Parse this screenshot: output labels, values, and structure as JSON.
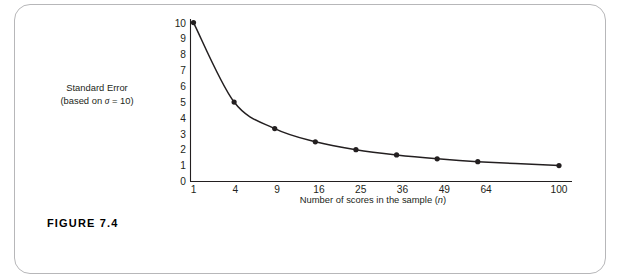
{
  "figure": {
    "caption": "FIGURE 7.4",
    "frame_color": "#b7b7b9",
    "background": "#ffffff"
  },
  "chart_data": {
    "type": "line",
    "title": "",
    "subtitle": "",
    "xlabel": "Number of scores in the sample (n)",
    "ylabel": "Standard Error (based on σ = 10)",
    "ylabel_line1": "Standard Error",
    "ylabel_line2_prefix": "(based on ",
    "ylabel_line2_sigma": "σ",
    "ylabel_line2_suffix": " = 10)",
    "xlabel_prefix": "Number of scores in the sample (",
    "xlabel_var": "n",
    "xlabel_suffix": ")",
    "x": [
      1,
      4,
      9,
      16,
      25,
      36,
      49,
      64,
      100
    ],
    "values": [
      10,
      5,
      3.33,
      2.5,
      2,
      1.67,
      1.43,
      1.25,
      1
    ],
    "xticks": [
      "1",
      "4",
      "9",
      "16",
      "25",
      "36",
      "49",
      "64",
      "100"
    ],
    "xtick_values": [
      1,
      4,
      9,
      16,
      25,
      36,
      49,
      64,
      100
    ],
    "yticks": [
      "0",
      "1",
      "2",
      "3",
      "4",
      "5",
      "6",
      "7",
      "8",
      "9",
      "10"
    ],
    "ytick_values": [
      0,
      1,
      2,
      3,
      4,
      5,
      6,
      7,
      8,
      9,
      10
    ],
    "xlim": [
      1,
      100
    ],
    "ylim": [
      0,
      10
    ],
    "x_scale": "sqrt",
    "grid": false,
    "legend": "none",
    "series": [
      {
        "name": "Standard error",
        "formula": "sigma / sqrt(n)",
        "sigma": 10,
        "values": [
          10,
          5,
          3.33,
          2.5,
          2,
          1.67,
          1.43,
          1.25,
          1
        ],
        "line_color": "#231f20",
        "marker_color": "#231f20",
        "marker": "circle"
      }
    ],
    "axis_color": "#231f20"
  }
}
